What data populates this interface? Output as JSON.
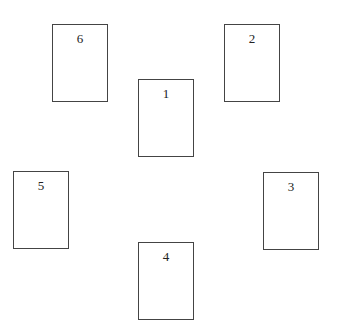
{
  "diagram": {
    "type": "card-spread-layout",
    "cards": [
      {
        "label": "6",
        "x": 52,
        "y": 24,
        "w": 56,
        "h": 78
      },
      {
        "label": "2",
        "x": 224,
        "y": 24,
        "w": 56,
        "h": 78
      },
      {
        "label": "1",
        "x": 138,
        "y": 79,
        "w": 56,
        "h": 78
      },
      {
        "label": "5",
        "x": 13,
        "y": 171,
        "w": 56,
        "h": 78
      },
      {
        "label": "3",
        "x": 263,
        "y": 172,
        "w": 56,
        "h": 78
      },
      {
        "label": "4",
        "x": 138,
        "y": 242,
        "w": 56,
        "h": 78
      }
    ],
    "colors": {
      "border": "#444444",
      "text": "#222222",
      "background": "#ffffff"
    }
  }
}
